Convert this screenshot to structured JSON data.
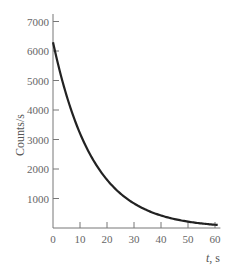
{
  "chart_data": {
    "type": "line",
    "title": "",
    "xlabel": "t, s",
    "ylabel": "Counts/s",
    "xlim": [
      0,
      62
    ],
    "ylim": [
      0,
      7200
    ],
    "x_ticks": [
      0,
      10,
      20,
      30,
      40,
      50,
      60
    ],
    "y_ticks": [
      1000,
      2000,
      3000,
      4000,
      5000,
      6000,
      7000
    ],
    "x_tick_labels": [
      "0",
      "10",
      "20",
      "30",
      "40",
      "50",
      "60"
    ],
    "y_tick_labels": [
      "1000",
      "2000",
      "3000",
      "4000",
      "5000",
      "6000",
      "7000"
    ],
    "grid": false,
    "legend": null,
    "series": [
      {
        "name": "Counting rate (exponential decay)",
        "x": [
          0,
          5,
          10,
          15,
          20,
          25,
          30,
          35,
          40,
          45,
          50,
          55,
          60
        ],
        "values": [
          6300,
          4500,
          3200,
          2300,
          1650,
          1180,
          840,
          600,
          430,
          310,
          220,
          160,
          110
        ]
      }
    ]
  },
  "labels": {
    "ylabel": "Counts/s",
    "xlabel_var": "t",
    "xlabel_unit": ", s"
  }
}
